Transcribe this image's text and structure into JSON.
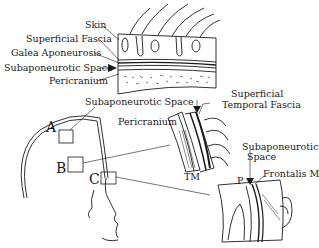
{
  "diagram": {
    "panelA_labels": {
      "skin": "Skin",
      "superficial_fascia": "Superficial Fascia",
      "galea": "Galea Aponeurosis",
      "subaponeurotic": "Subaponeurotic Space",
      "pericranium": "Pericranium"
    },
    "panelB_labels": {
      "subaponeurotic": "Subaponeurotic Space",
      "pericranium": "Pericranium",
      "superficial_temporal_1": "Superficial",
      "superficial_temporal_2": "Temporal Fascia",
      "tm": "TM"
    },
    "panelC_labels": {
      "subaponeurotic_1": "Subaponeurotic",
      "subaponeurotic_2": "Space",
      "p": "P",
      "frontalis": "Frontalis M"
    },
    "region_markers": {
      "a": "A",
      "b": "B",
      "c": "C"
    }
  }
}
